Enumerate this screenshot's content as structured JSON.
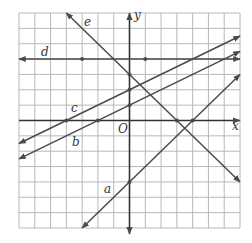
{
  "figure": {
    "type": "coordinate-plane-lines",
    "grid": {
      "x_min": -7,
      "x_max": 7,
      "y_min": -7,
      "y_max": 7,
      "step": 1
    },
    "axes": {
      "x_label": "x",
      "y_label": "y",
      "origin_label": "O"
    },
    "lines": [
      {
        "label": "a",
        "equation": "y = x - 4",
        "slope": 1,
        "intercept": -4,
        "from": [
          -3,
          -7
        ],
        "to": [
          7,
          3
        ],
        "arrow_start": true,
        "arrow_end": true,
        "points": [
          [
            0,
            -4
          ],
          [
            4,
            0
          ]
        ]
      },
      {
        "label": "b",
        "equation": "y = x/2 + 1",
        "slope": 0.5,
        "intercept": 1,
        "from": [
          -7,
          -2.5
        ],
        "to": [
          7,
          4.5
        ],
        "arrow_start": true,
        "arrow_end": true,
        "points": [
          [
            -2,
            0
          ],
          [
            0,
            1
          ]
        ]
      },
      {
        "label": "c",
        "equation": "y = x/2 + 2",
        "slope": 0.5,
        "intercept": 2,
        "from": [
          -7,
          -1.5
        ],
        "to": [
          7,
          5.5
        ],
        "arrow_start": true,
        "arrow_end": true,
        "points": [
          [
            -4,
            0
          ],
          [
            0,
            2
          ]
        ]
      },
      {
        "label": "d",
        "equation": "y = 4",
        "slope": 0,
        "intercept": 4,
        "from": [
          -7,
          4
        ],
        "to": [
          7,
          4
        ],
        "arrow_start": true,
        "arrow_end": true,
        "points": [
          [
            -3,
            4
          ],
          [
            1,
            4
          ]
        ]
      },
      {
        "label": "e",
        "equation": "y = -x + 3",
        "slope": -1,
        "intercept": 3,
        "from": [
          -4,
          7
        ],
        "to": [
          7,
          -4
        ],
        "arrow_start": true,
        "arrow_end": true,
        "points": [
          [
            0,
            3
          ],
          [
            3,
            0
          ]
        ]
      }
    ]
  },
  "colors": {
    "grid": "#b8b8b8",
    "line": "#4a4a4a",
    "axis": "#333333",
    "text": "#333333"
  }
}
